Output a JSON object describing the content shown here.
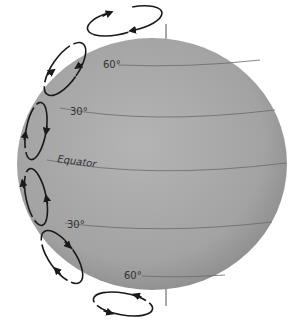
{
  "diagram": {
    "labels": {
      "lat60_north": "60°",
      "lat30_north": "30°",
      "equator": "Equator",
      "lat30_south": "30°",
      "lat60_south": "60°"
    },
    "colors": {
      "globe": "#a9a9a9",
      "globe_shade": "#8e8e8e",
      "latitude_lines": "#666666",
      "cells": "#1a1a1a"
    },
    "cells": [
      {
        "name": "polar-cell-north",
        "direction": "counterclockwise"
      },
      {
        "name": "ferrel-cell-north",
        "direction": "clockwise"
      },
      {
        "name": "hadley-cell-north",
        "direction": "counterclockwise"
      },
      {
        "name": "hadley-cell-south",
        "direction": "clockwise"
      },
      {
        "name": "ferrel-cell-south",
        "direction": "counterclockwise"
      },
      {
        "name": "polar-cell-south",
        "direction": "clockwise"
      }
    ]
  }
}
